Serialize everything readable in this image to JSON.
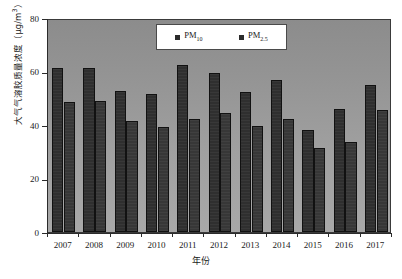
{
  "chart_data": {
    "type": "bar",
    "title": "",
    "xlabel": "年份",
    "ylabel": "大气气溶胶质量浓度（μg/m³）",
    "ylabel_main": "大气气溶胶质量浓度（μg/m",
    "ylabel_sup": "3",
    "ylabel_tail": "）",
    "categories": [
      "2007",
      "2008",
      "2009",
      "2010",
      "2011",
      "2012",
      "2013",
      "2014",
      "2015",
      "2016",
      "2017"
    ],
    "ylim": [
      0,
      80
    ],
    "yticks": [
      0,
      20,
      40,
      60,
      80
    ],
    "ytick_labels": [
      "0",
      "20",
      "40",
      "60",
      "80"
    ],
    "grid": false,
    "legend_position": "top-center",
    "series": [
      {
        "name": "PM10",
        "label_main": "PM",
        "label_sub": "10",
        "color": "#2f2f2f",
        "values": [
          61.3,
          61.3,
          52.6,
          51.6,
          62.4,
          59.6,
          52.5,
          56.8,
          38.0,
          46.1,
          54.8
        ]
      },
      {
        "name": "PM2.5",
        "label_main": "PM",
        "label_sub": "2.5",
        "color": "#373737",
        "values": [
          48.6,
          49.1,
          41.6,
          39.2,
          42.4,
          44.6,
          39.8,
          42.3,
          31.4,
          33.5,
          45.8
        ]
      }
    ]
  },
  "legend": {
    "items": [
      {
        "label_main": "PM",
        "label_sub": "10"
      },
      {
        "label_main": "PM",
        "label_sub": "2.5"
      }
    ]
  }
}
